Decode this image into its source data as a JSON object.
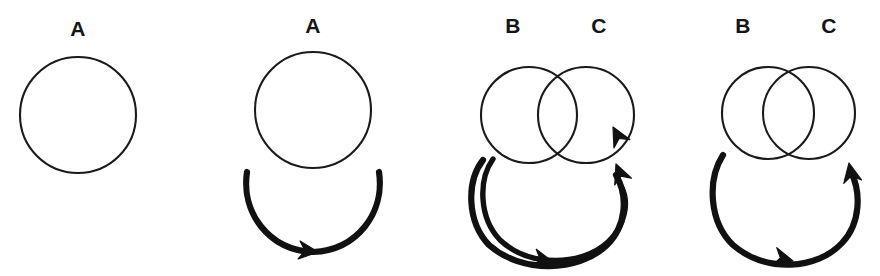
{
  "figure": {
    "background_color": "#ffffff",
    "stroke_color": "#111111",
    "circle_stroke_color": "#1a1a1a",
    "width": 880,
    "height": 276,
    "panels": [
      {
        "id": "panel-1",
        "name": "single-node-no-loop",
        "labels": [
          {
            "text": "A",
            "x": 78,
            "y": 36
          }
        ],
        "circles": [
          {
            "name": "node-a",
            "cx": 78,
            "cy": 115,
            "r": 58
          }
        ],
        "loops": [],
        "arrowheads": []
      },
      {
        "id": "panel-2",
        "name": "single-node-one-loop",
        "labels": [
          {
            "text": "A",
            "x": 313,
            "y": 33
          }
        ],
        "circles": [
          {
            "name": "node-a",
            "cx": 313,
            "cy": 110,
            "r": 58
          }
        ],
        "loops": [
          {
            "name": "self-loop-a",
            "d": "M 247 172 C 241 212 268 250 313 252 C 358 250 385 212 379 172"
          }
        ],
        "arrowheads": [
          {
            "name": "arrowhead-bottom",
            "x": 318,
            "y": 252,
            "angle": 6
          }
        ]
      },
      {
        "id": "panel-3",
        "name": "two-nodes-partial-overlap-two-loops",
        "labels": [
          {
            "text": "B",
            "x": 513,
            "y": 33
          },
          {
            "text": "C",
            "x": 599,
            "y": 33
          }
        ],
        "circles": [
          {
            "name": "node-b",
            "cx": 529,
            "cy": 115,
            "r": 48
          },
          {
            "name": "node-c",
            "cx": 586,
            "cy": 115,
            "r": 48
          }
        ],
        "loops": [
          {
            "name": "loop-outer",
            "d": "M 483 160 C 466 182 467 222 489 245 C 522 274 578 272 606 246 C 627 226 628 196 616 175"
          },
          {
            "name": "loop-inner",
            "d": "M 493 159 C 478 180 479 218 500 240 C 530 268 582 266 608 242 C 625 226 630 202 621 186"
          }
        ],
        "arrowheads": [
          {
            "name": "arrowhead-upper-right",
            "x": 613,
            "y": 127,
            "angle": -118
          },
          {
            "name": "arrowhead-lower-right",
            "x": 616,
            "y": 164,
            "angle": -112
          },
          {
            "name": "arrowhead-bottom",
            "x": 553,
            "y": 262,
            "angle": 12
          }
        ]
      },
      {
        "id": "panel-4",
        "name": "two-nodes-heavy-overlap-one-loop",
        "labels": [
          {
            "text": "B",
            "x": 743,
            "y": 33
          },
          {
            "text": "C",
            "x": 829,
            "y": 33
          }
        ],
        "circles": [
          {
            "name": "node-b",
            "cx": 768,
            "cy": 113,
            "r": 46
          },
          {
            "name": "node-c",
            "cx": 809,
            "cy": 113,
            "r": 46
          }
        ],
        "loops": [
          {
            "name": "self-loop-bc",
            "d": "M 723 155 C 707 180 709 222 733 245 C 766 273 817 270 842 243 C 861 223 861 192 851 172"
          }
        ],
        "arrowheads": [
          {
            "name": "arrowhead-right",
            "x": 849,
            "y": 163,
            "angle": -101
          },
          {
            "name": "arrowhead-bottom",
            "x": 793,
            "y": 261,
            "angle": 14
          }
        ]
      }
    ]
  }
}
